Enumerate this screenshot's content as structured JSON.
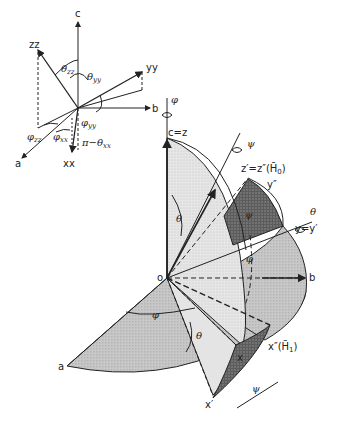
{
  "inset_diagram": {
    "axes": {
      "c": "c",
      "b": "b",
      "a": "a"
    },
    "vectors": {
      "zz": "zz",
      "yy": "yy",
      "xx": "xx"
    },
    "angles": {
      "theta_zz": {
        "symbol": "θ",
        "sub": "zz"
      },
      "theta_yy": {
        "symbol": "θ",
        "sub": "yy"
      },
      "phi_yy": {
        "symbol": "φ",
        "sub": "yy"
      },
      "phi_zz": {
        "symbol": "φ",
        "sub": "zz"
      },
      "phi_xx": {
        "symbol": "φ",
        "sub": "xx"
      },
      "pi_minus_theta_xx": {
        "symbol": "π−θ",
        "sub": "xx"
      }
    }
  },
  "main_diagram": {
    "rotation_phi": "φ",
    "rotation_psi": "ψ",
    "rotation_theta": "θ",
    "origin": "o",
    "axis_c_z": "c=z",
    "axis_z_prime": "z′=z″(H̄",
    "axis_z_prime_sub": "0",
    "axis_z_prime_close": ")",
    "axis_y_double_prime": "y″",
    "axis_y_eq": "y=y′",
    "axis_b": "b",
    "axis_a": "a",
    "axis_x_double_prime": "x″(H̄",
    "axis_x_double_prime_sub": "1",
    "axis_x_double_prime_close": ")",
    "axis_x": "x",
    "axis_x_prime": "x′",
    "angle_theta_top": "θ",
    "angle_psi_patch": "ψ",
    "angle_phi_right": "φ",
    "angle_phi_bottom": "φ",
    "angle_theta_bottom": "θ",
    "angle_psi_bottom": "ψ"
  },
  "colors": {
    "ink": "#222222",
    "light_shade": "#dcdcdc",
    "mid_shade": "#bdbdbd",
    "dark_shade": "#6e6e6e"
  }
}
